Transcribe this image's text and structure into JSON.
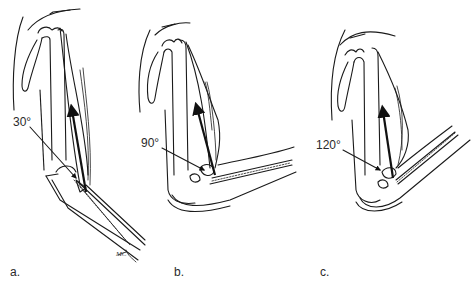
{
  "figure": {
    "panels": [
      {
        "id": "a",
        "label": "a.",
        "angle_label": "30°",
        "angle_deg": 30
      },
      {
        "id": "b",
        "label": "b.",
        "angle_label": "90°",
        "angle_deg": 90
      },
      {
        "id": "c",
        "label": "c.",
        "angle_label": "120°",
        "angle_deg": 120
      }
    ],
    "artist_initials": "MC",
    "colors": {
      "ink": "#1a1a1a",
      "background": "#ffffff"
    }
  }
}
